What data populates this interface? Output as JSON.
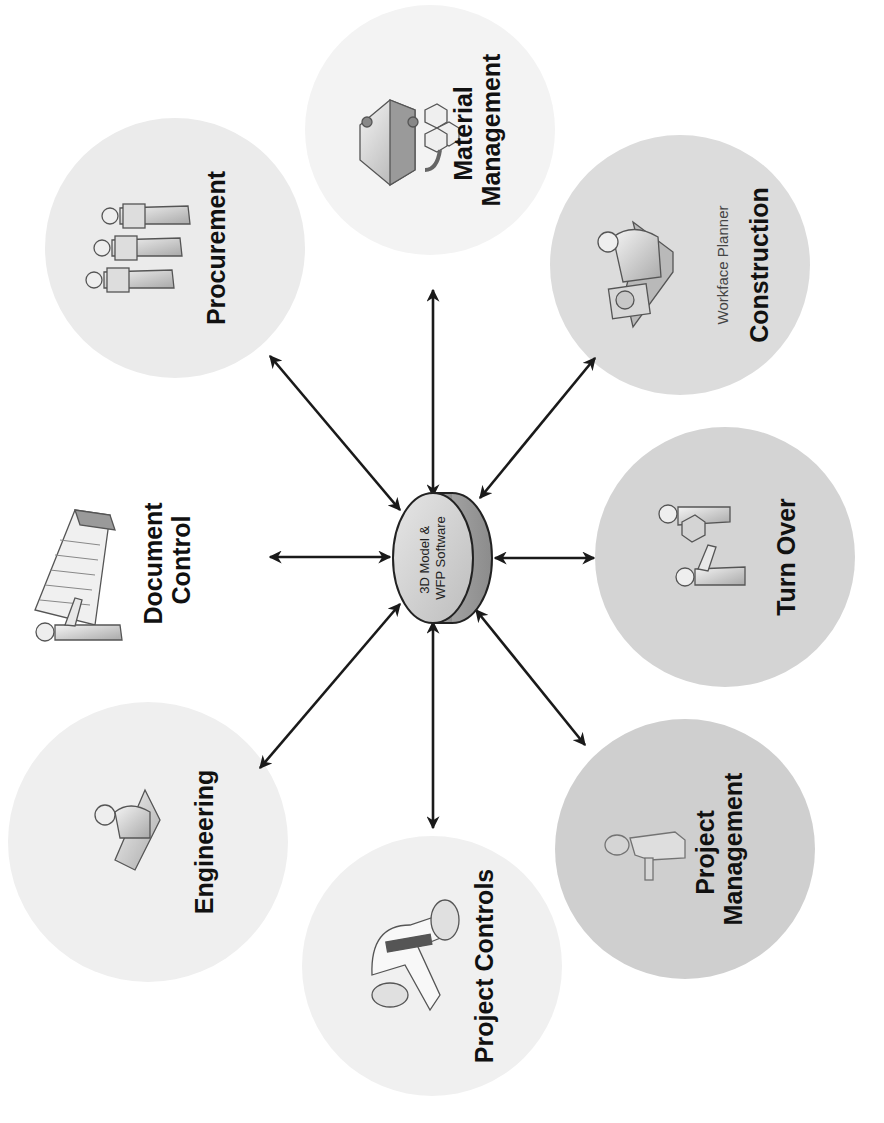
{
  "diagram": {
    "orientation": "rotated 90 degrees counter-clockwise",
    "hub": {
      "line1": "3D Model &",
      "line2": "WFP Software"
    },
    "nodes": [
      {
        "id": "engineering",
        "lines": [
          "Engineering"
        ],
        "icon": "engineer-at-drafting-table-icon",
        "fill": "#efefef"
      },
      {
        "id": "document-control",
        "lines": [
          "Document",
          "Control"
        ],
        "icon": "person-with-file-cabinet-icon",
        "fill": "#ffffff"
      },
      {
        "id": "procurement",
        "lines": [
          "Procurement"
        ],
        "icon": "three-people-with-boxes-icon",
        "fill": "#ebebeb"
      },
      {
        "id": "material-management",
        "lines": [
          "Material",
          "Management"
        ],
        "icon": "material-crates-icon",
        "fill": "#f3f3f3"
      },
      {
        "id": "construction",
        "lines": [
          "Construction"
        ],
        "sublabel": "Workface Planner",
        "icon": "planner-at-desk-icon",
        "fill": "#dcdcdc"
      },
      {
        "id": "turn-over",
        "lines": [
          "Turn Over"
        ],
        "icon": "handover-people-icon",
        "fill": "#d4d4d4"
      },
      {
        "id": "project-management",
        "lines": [
          "Project",
          "Management"
        ],
        "icon": "manager-person-icon",
        "fill": "#cfcfcf"
      },
      {
        "id": "project-controls",
        "lines": [
          "Project Controls"
        ],
        "icon": "controls-funnel-icon",
        "fill": "#f0f0f0"
      }
    ],
    "connections": [
      {
        "from": "hub",
        "to": "engineering",
        "type": "bidirectional"
      },
      {
        "from": "hub",
        "to": "document-control",
        "type": "bidirectional"
      },
      {
        "from": "hub",
        "to": "procurement",
        "type": "bidirectional"
      },
      {
        "from": "hub",
        "to": "material-management",
        "type": "bidirectional"
      },
      {
        "from": "hub",
        "to": "construction",
        "type": "bidirectional"
      },
      {
        "from": "hub",
        "to": "turn-over",
        "type": "bidirectional"
      },
      {
        "from": "hub",
        "to": "project-management",
        "type": "bidirectional"
      },
      {
        "from": "hub",
        "to": "project-controls",
        "type": "bidirectional"
      }
    ]
  }
}
